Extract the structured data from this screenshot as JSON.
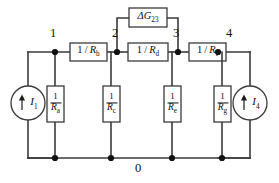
{
  "figure": {
    "background_color": "#ffffff",
    "wire_color": "#3b3b3b",
    "text_color": "#111111"
  },
  "nodes": [
    {
      "id": "node-1",
      "label": "1",
      "x": 55,
      "y": 52
    },
    {
      "id": "node-2",
      "label": "2",
      "x": 117,
      "y": 52
    },
    {
      "id": "node-3",
      "label": "3",
      "x": 178,
      "y": 52
    },
    {
      "id": "node-4",
      "label": "4",
      "x": 218,
      "y": 52
    },
    {
      "id": "node-0",
      "label": "0",
      "x": 139,
      "y": 160
    }
  ],
  "series_elements": [
    {
      "id": "rb",
      "numerator": "1",
      "denominator": "R",
      "subscript": "b",
      "label": "1 / R",
      "between": [
        "1",
        "2"
      ]
    },
    {
      "id": "rd",
      "numerator": "1",
      "denominator": "R",
      "subscript": "d",
      "label": "1 / R",
      "between": [
        "2",
        "3"
      ]
    },
    {
      "id": "rf",
      "numerator": "1",
      "denominator": "R",
      "subscript": "f",
      "label": "1 / R",
      "between": [
        "3",
        "4"
      ]
    }
  ],
  "delta_element": {
    "id": "dg23",
    "symbol": "ΔG",
    "subscript": "23",
    "between": [
      "2",
      "3"
    ]
  },
  "shunt_elements": [
    {
      "id": "ra",
      "numerator": "1",
      "denominator": "R",
      "subscript": "a",
      "at_node": "1"
    },
    {
      "id": "rc",
      "numerator": "1",
      "denominator": "R",
      "subscript": "c",
      "at_node": "2"
    },
    {
      "id": "re",
      "numerator": "1",
      "denominator": "R",
      "subscript": "e",
      "at_node": "3"
    },
    {
      "id": "rg",
      "numerator": "1",
      "denominator": "R",
      "subscript": "g",
      "at_node": "4"
    }
  ],
  "sources": [
    {
      "id": "i1",
      "symbol": "I",
      "subscript": "1",
      "arrow": "up",
      "at_node": "1"
    },
    {
      "id": "i4",
      "symbol": "I",
      "subscript": "4",
      "arrow": "up",
      "at_node": "4"
    }
  ]
}
